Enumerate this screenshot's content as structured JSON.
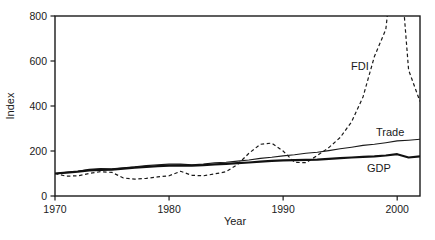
{
  "chart_data": {
    "type": "line",
    "title": "",
    "xlabel": "Year",
    "ylabel": "Index",
    "xlim": [
      1970,
      2002
    ],
    "ylim": [
      0,
      800
    ],
    "x_ticks": [
      1970,
      1980,
      1990,
      2000
    ],
    "y_ticks": [
      0,
      200,
      400,
      600,
      800
    ],
    "grid": false,
    "legend": "inline-labels-on-plot",
    "frame": "full-box",
    "axis_color": "#1a1a1a",
    "x": [
      1970,
      1971,
      1972,
      1973,
      1974,
      1975,
      1976,
      1977,
      1978,
      1979,
      1980,
      1981,
      1982,
      1983,
      1984,
      1985,
      1986,
      1987,
      1988,
      1989,
      1990,
      1991,
      1992,
      1993,
      1994,
      1995,
      1996,
      1997,
      1998,
      1999,
      2000,
      2001,
      2002
    ],
    "series": [
      {
        "name": "FDI",
        "style": "dashed",
        "color": "#1a1a1a",
        "width": 1.2,
        "values": [
          100,
          88,
          90,
          100,
          108,
          105,
          80,
          75,
          78,
          85,
          90,
          110,
          92,
          90,
          98,
          108,
          140,
          190,
          230,
          235,
          200,
          150,
          148,
          180,
          215,
          260,
          330,
          440,
          620,
          740,
          1200,
          560,
          420
        ]
      },
      {
        "name": "Trade",
        "style": "solid",
        "color": "#1a1a1a",
        "width": 1.1,
        "values": [
          100,
          105,
          110,
          118,
          122,
          121,
          126,
          130,
          135,
          139,
          142,
          142,
          139,
          142,
          148,
          150,
          155,
          160,
          167,
          172,
          178,
          183,
          190,
          194,
          202,
          210,
          217,
          225,
          230,
          237,
          245,
          248,
          252
        ]
      },
      {
        "name": "GDP",
        "style": "solid",
        "color": "#111111",
        "width": 2.2,
        "values": [
          100,
          104,
          108,
          114,
          116,
          117,
          122,
          126,
          130,
          133,
          135,
          136,
          135,
          137,
          141,
          143,
          146,
          149,
          153,
          156,
          158,
          159,
          161,
          162,
          165,
          168,
          171,
          174,
          176,
          180,
          186,
          171,
          176
        ]
      }
    ]
  }
}
